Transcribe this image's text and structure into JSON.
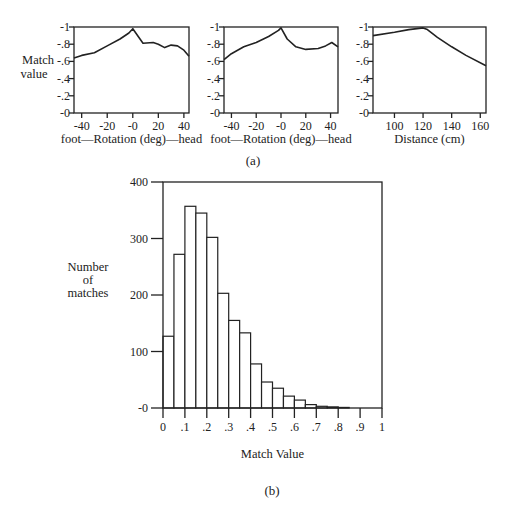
{
  "figure": {
    "panel_a_label": "(a)",
    "panel_b_label": "(b)"
  },
  "chart_data": [
    {
      "id": "rotation-1",
      "type": "line",
      "title": "",
      "xlabel": "foot—Rotation (deg)—head",
      "ylabel": "Match value",
      "xlim": [
        -46,
        44
      ],
      "ylim": [
        0,
        1
      ],
      "xticks": [
        -40,
        -20,
        0,
        20,
        40
      ],
      "xtick_labels": [
        "-40",
        "-20",
        "-0",
        "20",
        "40"
      ],
      "yticks": [
        0,
        0.2,
        0.4,
        0.6,
        0.8,
        1.0
      ],
      "ytick_labels": [
        "-0",
        "-.2",
        "-.4",
        "-.6",
        "-.8",
        "-1"
      ],
      "x": [
        -46,
        -40,
        -30,
        -20,
        -10,
        -3,
        0,
        8,
        16,
        20,
        25,
        30,
        35,
        40,
        44
      ],
      "y": [
        0.64,
        0.67,
        0.7,
        0.78,
        0.86,
        0.93,
        0.98,
        0.81,
        0.82,
        0.8,
        0.76,
        0.79,
        0.78,
        0.73,
        0.66
      ]
    },
    {
      "id": "rotation-2",
      "type": "line",
      "title": "",
      "xlabel": "foot—Rotation (deg)—head",
      "ylabel": "",
      "xlim": [
        -46,
        46
      ],
      "ylim": [
        0,
        1
      ],
      "xticks": [
        -40,
        -20,
        0,
        20,
        40
      ],
      "xtick_labels": [
        "-40",
        "-20",
        "-0",
        "20",
        "40"
      ],
      "yticks": [
        0,
        0.2,
        0.4,
        0.6,
        0.8,
        1.0
      ],
      "ytick_labels": [
        "-0",
        "-.2",
        "-.4",
        "-.6",
        "-.8",
        "-1"
      ],
      "x": [
        -46,
        -40,
        -30,
        -20,
        -10,
        -2,
        0,
        5,
        12,
        20,
        30,
        36,
        41,
        46
      ],
      "y": [
        0.62,
        0.69,
        0.77,
        0.82,
        0.89,
        0.96,
        0.99,
        0.86,
        0.77,
        0.74,
        0.75,
        0.78,
        0.82,
        0.77
      ]
    },
    {
      "id": "distance",
      "type": "line",
      "title": "",
      "xlabel": "Distance (cm)",
      "ylabel": "",
      "xlim": [
        85,
        164
      ],
      "ylim": [
        0,
        1
      ],
      "xticks": [
        100,
        120,
        140,
        160
      ],
      "xtick_labels": [
        "100",
        "120",
        "140",
        "160"
      ],
      "yticks": [
        0,
        0.2,
        0.4,
        0.6,
        0.8,
        1.0
      ],
      "ytick_labels": [
        "-0",
        "-.2",
        "-.4",
        "-.6",
        "-.8",
        "-1"
      ],
      "x": [
        85,
        100,
        110,
        120,
        123,
        130,
        140,
        150,
        164
      ],
      "y": [
        0.9,
        0.94,
        0.97,
        0.99,
        0.97,
        0.88,
        0.77,
        0.67,
        0.55
      ]
    },
    {
      "id": "histogram",
      "type": "bar",
      "title": "",
      "xlabel": "Match Value",
      "ylabel": "Number of matches",
      "ylabel_lines": [
        "Number",
        "of",
        "matches"
      ],
      "xlim": [
        0,
        1
      ],
      "ylim": [
        0,
        400
      ],
      "bin_width": 0.05,
      "bin_starts": [
        0,
        0.05,
        0.1,
        0.15,
        0.2,
        0.25,
        0.3,
        0.35,
        0.4,
        0.45,
        0.5,
        0.55,
        0.6,
        0.65,
        0.7,
        0.75,
        0.8
      ],
      "values": [
        127,
        272,
        357,
        345,
        302,
        203,
        155,
        133,
        78,
        46,
        35,
        21,
        14,
        6,
        3,
        2,
        1
      ],
      "xticks": [
        0,
        0.1,
        0.2,
        0.3,
        0.4,
        0.5,
        0.6,
        0.7,
        0.8,
        0.9,
        1.0
      ],
      "xtick_labels": [
        "0",
        ".1",
        ".2",
        ".3",
        ".4",
        ".5",
        ".6",
        ".7",
        ".8",
        ".9",
        "1"
      ],
      "yticks": [
        0,
        100,
        200,
        300,
        400
      ],
      "ytick_labels": [
        "-0",
        "100",
        "200",
        "300",
        "400"
      ]
    }
  ]
}
